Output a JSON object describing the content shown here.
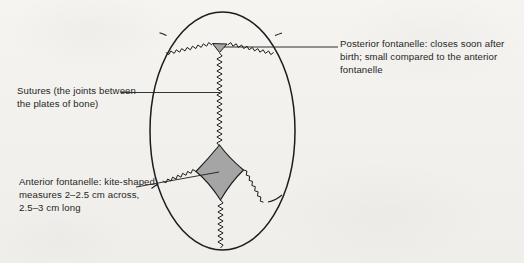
{
  "figure": {
    "background_color": "#f3f2ef",
    "ink_color": "#1c1c1c",
    "fontanelle_fill": "#a5a5a5"
  },
  "labels": {
    "posterior_fontanelle": "Posterior fontanelle: closes soon after birth; small compared to the anterior fontanelle",
    "sutures": "Sutures (the joints between the plates of bone)",
    "anterior_fontanelle": "Anterior fontanelle: kite-shaped; measures 2–2.5 cm across, 2.5–3 cm long"
  },
  "diagram_parts": {
    "skull_outline": "skull-outline",
    "sagittal_suture": "sagittal-suture",
    "lambdoid_suture_left": "lambdoid-suture-left",
    "lambdoid_suture_right": "lambdoid-suture-right",
    "coronal_suture_left": "coronal-suture-left",
    "coronal_suture_right": "coronal-suture-right",
    "frontal_suture": "frontal-suture",
    "posterior_fontanelle_shape": "triangle",
    "anterior_fontanelle_shape": "kite"
  }
}
